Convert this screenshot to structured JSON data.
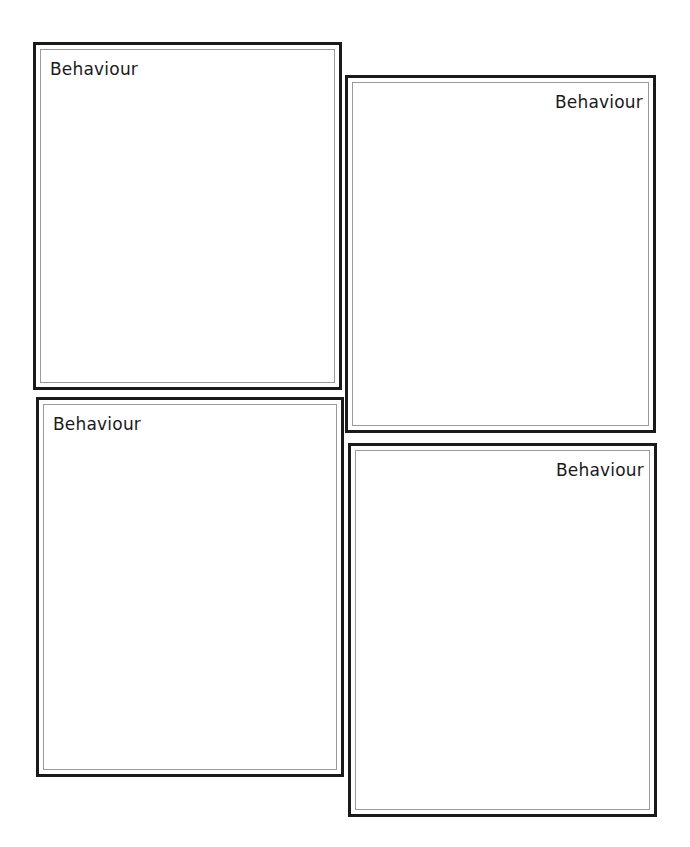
{
  "worksheet": {
    "panels": [
      {
        "label": "Behaviour",
        "label_align": "left"
      },
      {
        "label": "Behaviour",
        "label_align": "right"
      },
      {
        "label": "Behaviour",
        "label_align": "left"
      },
      {
        "label": "Behaviour",
        "label_align": "right"
      }
    ]
  },
  "colors": {
    "border": "#1a1a1a",
    "inner_border": "#9a9a9a",
    "background": "#ffffff"
  }
}
